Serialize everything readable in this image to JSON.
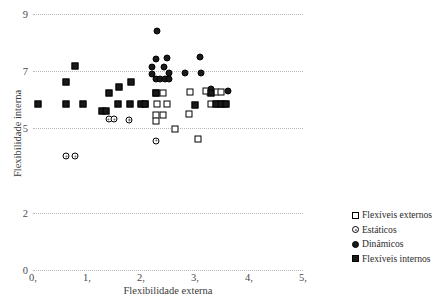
{
  "chart_data": {
    "type": "scatter",
    "title": "",
    "xlabel": "Flexibilidade externa",
    "ylabel": "Flexibilidade interna",
    "xlim": [
      0,
      5
    ],
    "ylim": [
      0,
      9
    ],
    "grid": true,
    "legend_position": "right",
    "xticks": [
      "0,",
      "1,",
      "2,",
      "3,",
      "4,",
      "5,"
    ],
    "xtick_values": [
      0,
      1,
      2,
      3,
      4,
      5
    ],
    "yticks": [
      "9",
      "7",
      "5",
      "2",
      "0"
    ],
    "ytick_values": [
      9,
      7,
      5,
      2,
      0
    ],
    "series": [
      {
        "name": "Flexíveis externos",
        "marker": "sq-open",
        "points": [
          [
            2.28,
            6.22
          ],
          [
            2.4,
            6.22
          ],
          [
            2.08,
            5.82
          ],
          [
            2.3,
            5.82
          ],
          [
            2.48,
            5.82
          ],
          [
            2.28,
            5.45
          ],
          [
            2.28,
            5.25
          ],
          [
            2.4,
            5.45
          ],
          [
            2.63,
            4.95
          ],
          [
            2.9,
            6.25
          ],
          [
            2.88,
            5.48
          ],
          [
            3.05,
            4.6
          ],
          [
            3.28,
            6.25
          ],
          [
            3.38,
            6.25
          ],
          [
            3.48,
            6.25
          ],
          [
            3.3,
            5.82
          ],
          [
            3.42,
            5.82
          ],
          [
            3.54,
            5.82
          ],
          [
            3.2,
            6.3
          ]
        ]
      },
      {
        "name": "Estáticos",
        "marker": "ci-open",
        "points": [
          [
            1.4,
            5.3
          ],
          [
            1.5,
            5.3
          ],
          [
            1.78,
            5.28
          ],
          [
            2.28,
            4.55
          ],
          [
            0.62,
            4.0
          ],
          [
            0.78,
            4.0
          ]
        ]
      },
      {
        "name": "Dinâmicos",
        "marker": "ci-filled",
        "points": [
          [
            2.3,
            8.4
          ],
          [
            2.28,
            7.42
          ],
          [
            2.48,
            7.45
          ],
          [
            2.2,
            7.15
          ],
          [
            2.42,
            7.12
          ],
          [
            2.2,
            6.88
          ],
          [
            2.28,
            6.72
          ],
          [
            2.36,
            6.7
          ],
          [
            2.44,
            6.7
          ],
          [
            2.52,
            6.72
          ],
          [
            2.52,
            6.92
          ],
          [
            2.82,
            6.92
          ],
          [
            3.1,
            7.48
          ],
          [
            3.12,
            6.92
          ],
          [
            3.3,
            6.35
          ],
          [
            3.62,
            6.3
          ]
        ]
      },
      {
        "name": "Flexíveis internos",
        "marker": "sq-filled",
        "points": [
          [
            0.1,
            5.82
          ],
          [
            0.62,
            5.82
          ],
          [
            0.62,
            6.6
          ],
          [
            0.78,
            7.18
          ],
          [
            0.92,
            5.82
          ],
          [
            1.28,
            5.58
          ],
          [
            1.36,
            5.58
          ],
          [
            1.4,
            6.22
          ],
          [
            1.58,
            5.82
          ],
          [
            1.6,
            6.42
          ],
          [
            1.8,
            5.82
          ],
          [
            1.82,
            6.6
          ],
          [
            2.0,
            5.82
          ],
          [
            2.08,
            5.82
          ],
          [
            2.28,
            6.22
          ],
          [
            3.0,
            5.8
          ],
          [
            3.38,
            5.82
          ],
          [
            3.48,
            5.82
          ],
          [
            3.58,
            5.82
          ],
          [
            3.3,
            6.22
          ]
        ]
      }
    ]
  },
  "legend": {
    "items": [
      {
        "label": "Flexíveis externos",
        "marker": "sq-open"
      },
      {
        "label": "Estáticos",
        "marker": "ci-open"
      },
      {
        "label": "Dinâmicos",
        "marker": "ci-filled"
      },
      {
        "label": "Flexíveis internos",
        "marker": "sq-filled"
      }
    ]
  },
  "colors": {
    "marker": "#1a1a1a",
    "grid": "#b9b9b9",
    "text": "#2b2b2b",
    "background": "#ffffff"
  }
}
